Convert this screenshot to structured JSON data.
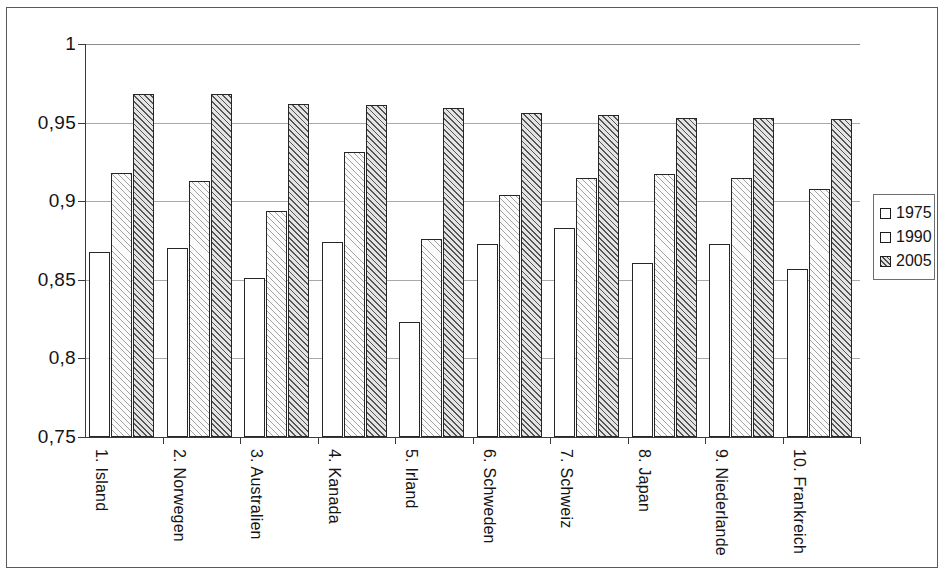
{
  "chart_data": {
    "type": "bar",
    "title": "",
    "subtitle": "",
    "xlabel": "",
    "ylabel": "",
    "ylim": [
      0.75,
      1
    ],
    "yticks": [
      "0,75",
      "0,8",
      "0,85",
      "0,9",
      "0,95",
      "1"
    ],
    "ytick_values": [
      0.75,
      0.8,
      0.85,
      0.9,
      0.95,
      1
    ],
    "grid": true,
    "legend_position": "right",
    "categories": [
      "1. Island",
      "2. Norwegen",
      "3. Australien",
      "4. Kanada",
      "5. Irland",
      "6. Schweden",
      "7. Schweiz",
      "8. Japan",
      "9. Niederlande",
      "10. Frankreich"
    ],
    "series": [
      {
        "name": "1975",
        "values": [
          0.868,
          0.87,
          0.851,
          0.874,
          0.823,
          0.873,
          0.883,
          0.861,
          0.873,
          0.857
        ]
      },
      {
        "name": "1990",
        "values": [
          0.918,
          0.913,
          0.894,
          0.931,
          0.876,
          0.904,
          0.915,
          0.917,
          0.915,
          0.908
        ]
      },
      {
        "name": "2005",
        "values": [
          0.968,
          0.968,
          0.962,
          0.961,
          0.959,
          0.956,
          0.955,
          0.953,
          0.953,
          0.952
        ]
      }
    ]
  },
  "legend": {
    "items": [
      {
        "label": "1975",
        "swatch": "empty-square-swatch"
      },
      {
        "label": "1990",
        "swatch": "light-hatch-square-swatch"
      },
      {
        "label": "2005",
        "swatch": "dark-hatch-square-swatch"
      }
    ]
  }
}
